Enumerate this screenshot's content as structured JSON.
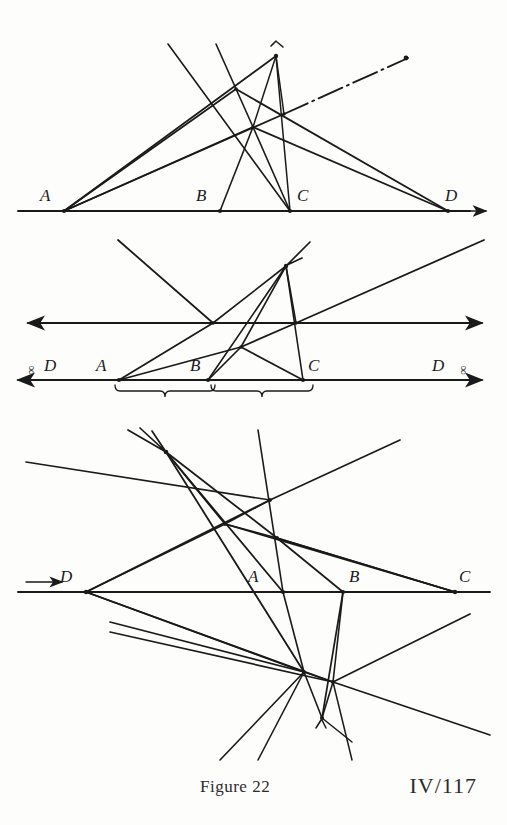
{
  "page": {
    "width": 507,
    "height": 825,
    "background_color": "#fdfdfc",
    "ink_color": "#1a1a1a"
  },
  "caption": {
    "figure_label": "Figure 22",
    "page_reference": "IV/117"
  },
  "diagrams": [
    {
      "id": "diagram-top",
      "name": "harmonic-construction-finite",
      "baseline_y": 211,
      "points": [
        {
          "label": "A",
          "x": 64,
          "y": 211,
          "label_x": 40,
          "label_y": 186
        },
        {
          "label": "B",
          "x": 220,
          "y": 211,
          "label_x": 196,
          "label_y": 186
        },
        {
          "label": "C",
          "x": 290,
          "y": 211,
          "label_x": 297,
          "label_y": 186
        },
        {
          "label": "D",
          "x": 448,
          "y": 211,
          "label_x": 445,
          "label_y": 186
        }
      ],
      "apex": {
        "x": 276,
        "y": 56
      },
      "inner_nodes": [
        {
          "x": 236,
          "y": 89
        },
        {
          "x": 284,
          "y": 114
        },
        {
          "x": 253,
          "y": 127
        }
      ],
      "arrow_right": true,
      "dash_dot_ray": true
    },
    {
      "id": "diagram-middle",
      "name": "harmonic-construction-point-at-infinity",
      "baseline_y": 380,
      "axis_y": 323,
      "points": [
        {
          "label": "A",
          "x": 119,
          "y": 380,
          "label_x": 96,
          "label_y": 356
        },
        {
          "label": "B",
          "x": 208,
          "y": 380,
          "label_x": 190,
          "label_y": 356
        },
        {
          "label": "C",
          "x": 303,
          "y": 380,
          "label_x": 308,
          "label_y": 356
        }
      ],
      "infinity_points": [
        {
          "label": "D",
          "symbol": "∞",
          "side": "left",
          "label_x": 44,
          "label_y": 356
        },
        {
          "label": "D",
          "symbol": "∞",
          "side": "right",
          "label_x": 432,
          "label_y": 356
        }
      ],
      "apex": {
        "x": 286,
        "y": 266
      },
      "inner_nodes": [
        {
          "x": 213,
          "y": 323
        },
        {
          "x": 296,
          "y": 323
        },
        {
          "x": 241,
          "y": 347
        }
      ],
      "braces": [
        {
          "from_x": 115,
          "to_x": 207,
          "y": 387
        },
        {
          "from_x": 211,
          "to_x": 305,
          "y": 387
        }
      ]
    },
    {
      "id": "diagram-bottom",
      "name": "harmonic-construction-external-point",
      "baseline_y": 592,
      "points": [
        {
          "label": "D",
          "x": 86,
          "y": 592,
          "label_x": 60,
          "label_y": 567
        },
        {
          "label": "A",
          "x": 283,
          "y": 592,
          "label_x": 248,
          "label_y": 567
        },
        {
          "label": "B",
          "x": 343,
          "y": 592,
          "label_x": 349,
          "label_y": 567
        },
        {
          "label": "C",
          "x": 455,
          "y": 592,
          "label_x": 459,
          "label_y": 567
        }
      ],
      "upper_vertex": {
        "x": 166,
        "y": 452
      },
      "inner_nodes": [
        {
          "x": 225,
          "y": 524
        },
        {
          "x": 270,
          "y": 500
        },
        {
          "x": 277,
          "y": 538
        },
        {
          "x": 304,
          "y": 672
        },
        {
          "x": 333,
          "y": 682
        },
        {
          "x": 322,
          "y": 718
        }
      ],
      "arrow_left": true
    }
  ]
}
